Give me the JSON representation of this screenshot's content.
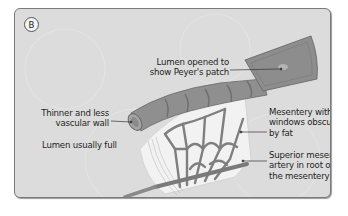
{
  "figure": {
    "panel_label": "B",
    "caption_fragment": "",
    "labels": {
      "lumen_opened": [
        "Lumen opened to",
        "show Peyer's patch"
      ],
      "mesentery_windows": [
        "Mesentery with",
        "windows obscured",
        "by fat"
      ],
      "thinner_wall": [
        "Thinner and less",
        "vascular wall"
      ],
      "lumen_full": "Lumen usually full",
      "superior_artery": [
        "Superior mesenteric",
        "artery in root of",
        "the mesentery"
      ]
    },
    "colors": {
      "panel_bg": "#dcdcdc",
      "panel_border": "#7a7a7a",
      "intestine": "#8c8c8c",
      "vessels": "#808080",
      "mesentery_fat": "#f2f2f2"
    }
  }
}
